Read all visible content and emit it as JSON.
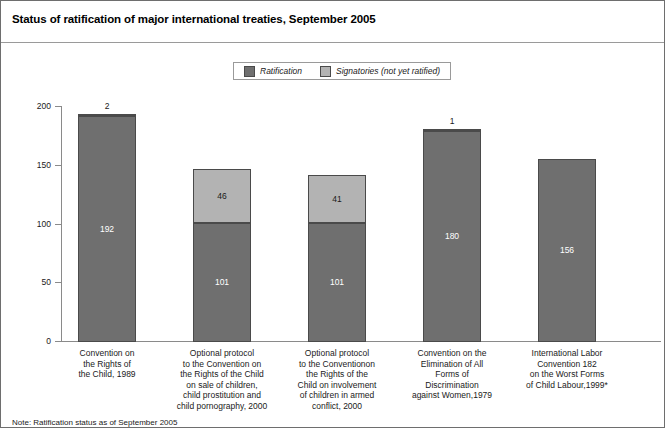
{
  "header": {
    "title": "Status of ratification of major international treaties, September 2005"
  },
  "footnote": {
    "text": "Note: Ratification status as of September 2005"
  },
  "colors": {
    "ratification": "#6f6f6f",
    "signatories": "#b3b3b3",
    "bar_border": "#4a4a4a",
    "axis": "#8a8a8a",
    "frame": "#6e6e6e",
    "text": "#1a1a1a"
  },
  "legend": {
    "position": "top-center",
    "entries": [
      {
        "label": "Ratification",
        "color": "#6f6f6f"
      },
      {
        "label": "Signatories (not yet ratified)",
        "color": "#b3b3b3"
      }
    ]
  },
  "chart_data": {
    "type": "bar",
    "subtype": "stacked",
    "title": "Status of ratification of major international treaties, September 2005",
    "xlabel": "",
    "ylabel": "Numbers of countries",
    "ylim": [
      0,
      200
    ],
    "yticks": [
      0,
      50,
      100,
      150,
      200
    ],
    "ytick_labels": [
      "0",
      "50",
      "100",
      "150",
      "200"
    ],
    "grid": false,
    "legend_position": "top-center",
    "categories": [
      "Convention on\nthe Rights of\nthe Child, 1989",
      "Optional protocol\nto the Convention on\nthe Rights of the Child\non sale of children,\nchild prostitution and\nchild pornography, 2000",
      "Optional protocol\nto the Conventionon\nthe Rights of the\nChild on involvement\nof children in armed\nconflict, 2000",
      "Convention on the\nElimination of All\nForms of\nDiscrimination\nagainst Women,1979",
      "International Labor\nConvention 182\non the Worst Forms\nof Child Labour,1999*"
    ],
    "series": [
      {
        "name": "Ratification",
        "color": "#6f6f6f",
        "values": [
          192,
          101,
          101,
          180,
          156
        ]
      },
      {
        "name": "Signatories (not yet ratified)",
        "color": "#b3b3b3",
        "values": [
          2,
          46,
          41,
          1,
          0
        ]
      }
    ],
    "totals": [
      194,
      147,
      142,
      181,
      156
    ],
    "data_labels": {
      "ratification": [
        "192",
        "101",
        "101",
        "180",
        "156"
      ],
      "signatories": [
        "2",
        "46",
        "41",
        "1",
        ""
      ]
    }
  },
  "bars": [
    {
      "index": 0,
      "category_lines": [
        "Convention on",
        "the Rights of",
        "the Child, 1989"
      ],
      "ratification": 192,
      "signatories": 2,
      "ratification_label": "192",
      "signatories_label": "2",
      "signatories_label_placement": "above"
    },
    {
      "index": 1,
      "category_lines": [
        "Optional protocol",
        "to the Convention on",
        "the Rights of the Child",
        "on sale of children,",
        "child prostitution and",
        "child pornography, 2000"
      ],
      "ratification": 101,
      "signatories": 46,
      "ratification_label": "101",
      "signatories_label": "46",
      "signatories_label_placement": "inside"
    },
    {
      "index": 2,
      "category_lines": [
        "Optional protocol",
        "to the Conventionon",
        "the Rights of the",
        "Child on involvement",
        "of children in armed",
        "conflict, 2000"
      ],
      "ratification": 101,
      "signatories": 41,
      "ratification_label": "101",
      "signatories_label": "41",
      "signatories_label_placement": "inside"
    },
    {
      "index": 3,
      "category_lines": [
        "Convention on the",
        "Elimination of All",
        "Forms of",
        "Discrimination",
        "against Women,1979"
      ],
      "ratification": 180,
      "signatories": 1,
      "ratification_label": "180",
      "signatories_label": "1",
      "signatories_label_placement": "above"
    },
    {
      "index": 4,
      "category_lines": [
        "International Labor",
        "Convention 182",
        "on the Worst Forms",
        "of Child Labour,1999*"
      ],
      "ratification": 156,
      "signatories": 0,
      "ratification_label": "156",
      "signatories_label": "",
      "signatories_label_placement": "none"
    }
  ]
}
